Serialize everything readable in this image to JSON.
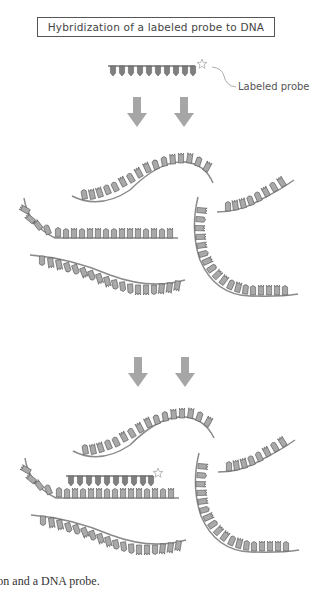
{
  "title": "Hybridization of a labeled probe to DNA",
  "probe_label": "Labeled probe",
  "caption": "ion and a DNA probe.",
  "colors": {
    "strand": "#8a8a8a",
    "base_fill": "#a9a9a9",
    "base_stroke": "#555555",
    "arrow": "#a6a6a6",
    "probe_fill": "#7f7f7f",
    "star": "#c0c0c0"
  },
  "stages": [
    {
      "name": "labeled-probe",
      "description": "Single-stranded labeled probe with star label"
    },
    {
      "name": "denatured-dna",
      "description": "Single-stranded DNA fragments"
    },
    {
      "name": "hybridized",
      "description": "Probe bound to complementary DNA strand"
    }
  ]
}
